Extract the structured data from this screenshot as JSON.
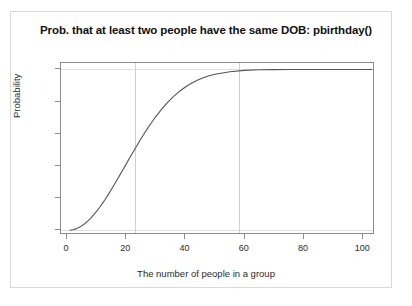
{
  "chart_data": {
    "type": "line",
    "title": "Prob. that at least two people have the same DOB: pbirthday()",
    "xlabel": "The number of people in a group",
    "ylabel": "Probability",
    "xlim": [
      -2,
      104
    ],
    "ylim": [
      -0.03,
      1.04
    ],
    "grid": true,
    "legend": null,
    "x_ticks": [
      {
        "value": 0,
        "label": "0"
      },
      {
        "value": 20,
        "label": "20"
      },
      {
        "value": 40,
        "label": "40"
      },
      {
        "value": 60,
        "label": "60"
      },
      {
        "value": 80,
        "label": "80"
      },
      {
        "value": 100,
        "label": "100"
      }
    ],
    "y_ticks": [
      {
        "value": 0.0,
        "label": "0.0"
      },
      {
        "value": 0.2,
        "label": "0.2"
      },
      {
        "value": 0.4,
        "label": "0.4"
      },
      {
        "value": 0.6,
        "label": "0.6"
      },
      {
        "value": 0.8,
        "label": "0.8"
      },
      {
        "value": 1.0,
        "label": "1.0"
      }
    ],
    "reference_lines": {
      "vertical": [
        23,
        58
      ],
      "horizontal": [
        0.0,
        1.0
      ]
    },
    "series": [
      {
        "name": "pbirthday",
        "color": "#555555",
        "x": [
          1,
          2,
          3,
          4,
          5,
          6,
          7,
          8,
          9,
          10,
          11,
          12,
          13,
          14,
          15,
          16,
          17,
          18,
          19,
          20,
          21,
          22,
          23,
          24,
          25,
          26,
          27,
          28,
          29,
          30,
          32,
          34,
          36,
          38,
          40,
          42,
          44,
          46,
          48,
          50,
          55,
          60,
          65,
          70,
          75,
          80,
          85,
          90,
          95,
          100,
          103
        ],
        "values": [
          0.0,
          0.003,
          0.008,
          0.016,
          0.027,
          0.04,
          0.056,
          0.074,
          0.095,
          0.117,
          0.141,
          0.167,
          0.194,
          0.223,
          0.253,
          0.284,
          0.315,
          0.347,
          0.379,
          0.411,
          0.444,
          0.476,
          0.507,
          0.538,
          0.569,
          0.598,
          0.627,
          0.654,
          0.681,
          0.706,
          0.753,
          0.795,
          0.832,
          0.864,
          0.891,
          0.914,
          0.933,
          0.948,
          0.961,
          0.97,
          0.986,
          0.994,
          0.998,
          0.999,
          1.0,
          1.0,
          1.0,
          1.0,
          1.0,
          1.0,
          1.0
        ]
      }
    ]
  },
  "axes": {
    "x_title": "The number of people in a group",
    "y_title": "Probability"
  },
  "caption": ""
}
